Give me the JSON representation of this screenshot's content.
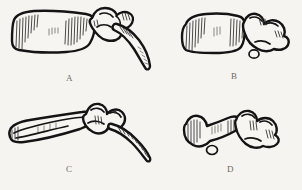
{
  "figure": {
    "kind": "anatomical-line-drawing-plate",
    "background_color": "#f6f4f0",
    "ink_color": "#141414",
    "label_color": "#6e6a66",
    "panel_count": 4,
    "layout": "2x2 grid",
    "panels": [
      {
        "id": "A",
        "label": "A",
        "position": "top-left",
        "description": "Vertebra in lateral view: blocky rectangular centrum at left with vertical hatching, neural arch and articular processes at right, long transverse process sweeping down and right",
        "label_x": 66,
        "label_y": 74
      },
      {
        "id": "B",
        "label": "B",
        "position": "top-right",
        "description": "Vertebra in lateral view: rectangular centrum at left with vertical hatching, knobbed neural arch at right with small oval foramen beneath",
        "label_x": 231,
        "label_y": 72
      },
      {
        "id": "C",
        "label": "C",
        "position": "bottom-left",
        "description": "Slender elongated vertebra: tapering blade-like centrum at left, irregular knobby arch at centre, long tapering rib with ladder hatching sweeping down and right",
        "label_x": 66,
        "label_y": 165
      },
      {
        "id": "D",
        "label": "D",
        "position": "bottom-right",
        "description": "Vertebra with hourglass or bowtie shaped centrum, flared ends with hatching, knobbed arch at right and small oval process hanging below centre",
        "label_x": 227,
        "label_y": 165
      }
    ]
  }
}
